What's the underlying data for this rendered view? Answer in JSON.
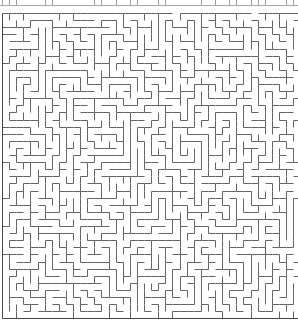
{
  "image": {
    "width": 298,
    "height": 320,
    "background": "#ffffff",
    "description": "orthogonal maze puzzle, cropped view"
  },
  "top_remnant": {
    "line_y": 5,
    "line_color": "#a8a8a8",
    "tick_color": "#9c9c9c",
    "tick_probability": 0.5,
    "seed": 52
  },
  "maze": {
    "origin_x": 2,
    "origin_y": 13,
    "cell_size": 7.1,
    "cols": 42,
    "rows": 43,
    "wall_color": "#646464",
    "border_color": "#454545",
    "wall_width": 1,
    "algorithm": "recursive-backtracker",
    "seed": 8891,
    "top_gap_probability": 0.1,
    "edges": {
      "left": "solid",
      "top": "solid-with-gaps",
      "bottom": "solid",
      "right": "cropped"
    }
  }
}
